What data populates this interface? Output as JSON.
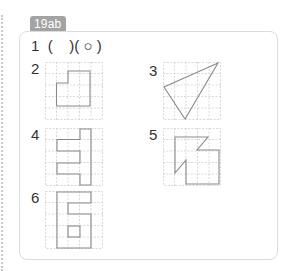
{
  "badge": {
    "label": "19ab",
    "color": "#a3a3a3"
  },
  "line1": {
    "number": "1",
    "answer_text": "(    )( ○ )"
  },
  "items": [
    {
      "number": "2",
      "shape": "stepped-rectangle"
    },
    {
      "number": "3",
      "shape": "triangle"
    },
    {
      "number": "4",
      "shape": "E-shape"
    },
    {
      "number": "5",
      "shape": "arrow-shape"
    },
    {
      "number": "6",
      "shape": "six-shape"
    }
  ],
  "colors": {
    "grid": "#cfcfcf",
    "shape_stroke": "#8a8a8a",
    "card_border": "#dcdcdc"
  }
}
